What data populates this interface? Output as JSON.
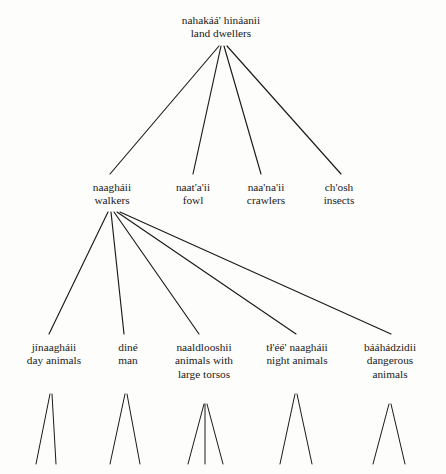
{
  "diagram": {
    "title_term": "nahakáá' hináanii",
    "title_gloss": "land dwellers",
    "ink_color": "#1a1a1a",
    "background_color": "#fdfdfb",
    "nodes": [
      {
        "id": "root",
        "term": "nahakáá' hináanii",
        "gloss": "land dwellers",
        "x": 221,
        "y": 14
      },
      {
        "id": "walkers",
        "term": "naagháii",
        "gloss": "walkers",
        "x": 112,
        "y": 181
      },
      {
        "id": "fowl",
        "term": "naat'a'ii",
        "gloss": "fowl",
        "x": 193,
        "y": 181
      },
      {
        "id": "crawlers",
        "term": "naa'na'ii",
        "gloss": "crawlers",
        "x": 266,
        "y": 181
      },
      {
        "id": "insects",
        "term": "ch'osh",
        "gloss": "insects",
        "x": 339,
        "y": 181
      },
      {
        "id": "day-animals",
        "term": "jínaagháii",
        "gloss": "day animals",
        "x": 54,
        "y": 341
      },
      {
        "id": "man",
        "term": "diné",
        "gloss": "man",
        "x": 128,
        "y": 341
      },
      {
        "id": "large-torsos",
        "term": "naaldlooshii",
        "gloss": "animals with large torsos",
        "x": 204,
        "y": 341
      },
      {
        "id": "night-animals",
        "term": "tł'éé' naagháii",
        "gloss": "night animals",
        "x": 297,
        "y": 341
      },
      {
        "id": "dangerous-animals",
        "term": "bááhádzidii",
        "gloss": "dangerous animals",
        "x": 390,
        "y": 341
      }
    ],
    "edges": [
      {
        "from": "root",
        "to": "walkers",
        "x1": 219,
        "y1": 46,
        "x2": 110,
        "y2": 174
      },
      {
        "from": "root",
        "to": "fowl",
        "x1": 221,
        "y1": 46,
        "x2": 193,
        "y2": 174
      },
      {
        "from": "root",
        "to": "crawlers",
        "x1": 224,
        "y1": 46,
        "x2": 261,
        "y2": 174
      },
      {
        "from": "root",
        "to": "insects",
        "x1": 227,
        "y1": 46,
        "x2": 341,
        "y2": 174
      },
      {
        "from": "walkers",
        "to": "day-animals",
        "x1": 108,
        "y1": 212,
        "x2": 49,
        "y2": 334
      },
      {
        "from": "walkers",
        "to": "man",
        "x1": 111,
        "y1": 212,
        "x2": 124,
        "y2": 334
      },
      {
        "from": "walkers",
        "to": "large-torsos",
        "x1": 114,
        "y1": 212,
        "x2": 199,
        "y2": 334
      },
      {
        "from": "walkers",
        "to": "night-animals",
        "x1": 117,
        "y1": 212,
        "x2": 296,
        "y2": 334
      },
      {
        "from": "walkers",
        "to": "dangerous-animals",
        "x1": 120,
        "y1": 212,
        "x2": 391,
        "y2": 334
      }
    ],
    "leaf_stubs": [
      {
        "parent": "day-animals",
        "x1": 50,
        "y1": 394,
        "x2": 36,
        "y2": 464
      },
      {
        "parent": "day-animals",
        "x1": 52,
        "y1": 394,
        "x2": 56,
        "y2": 464
      },
      {
        "parent": "man",
        "x1": 125,
        "y1": 394,
        "x2": 110,
        "y2": 464
      },
      {
        "parent": "man",
        "x1": 127,
        "y1": 394,
        "x2": 140,
        "y2": 464
      },
      {
        "parent": "large-torsos",
        "x1": 204,
        "y1": 404,
        "x2": 188,
        "y2": 464
      },
      {
        "parent": "large-torsos",
        "x1": 205,
        "y1": 404,
        "x2": 205,
        "y2": 464
      },
      {
        "parent": "large-torsos",
        "x1": 207,
        "y1": 404,
        "x2": 223,
        "y2": 464
      },
      {
        "parent": "night-animals",
        "x1": 295,
        "y1": 394,
        "x2": 280,
        "y2": 464
      },
      {
        "parent": "night-animals",
        "x1": 297,
        "y1": 394,
        "x2": 312,
        "y2": 464
      },
      {
        "parent": "dangerous-animals",
        "x1": 389,
        "y1": 404,
        "x2": 373,
        "y2": 464
      },
      {
        "parent": "dangerous-animals",
        "x1": 391,
        "y1": 404,
        "x2": 405,
        "y2": 464
      }
    ]
  }
}
